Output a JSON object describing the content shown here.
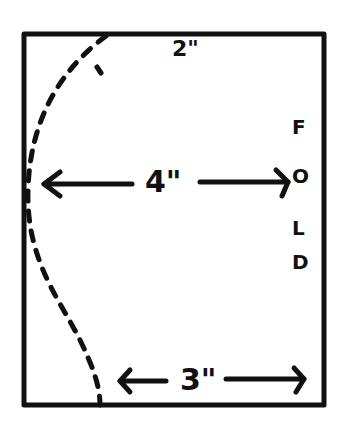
{
  "diagram": {
    "type": "pattern-template",
    "outline": "rectangle",
    "stroke_color": "#111111",
    "background": "#ffffff",
    "labels": {
      "top_width": "2\"",
      "middle_width": "4\"",
      "bottom_width": "3\"",
      "fold_letters": [
        "F",
        "O",
        "L",
        "D"
      ]
    },
    "curve": "dashed cut line"
  }
}
